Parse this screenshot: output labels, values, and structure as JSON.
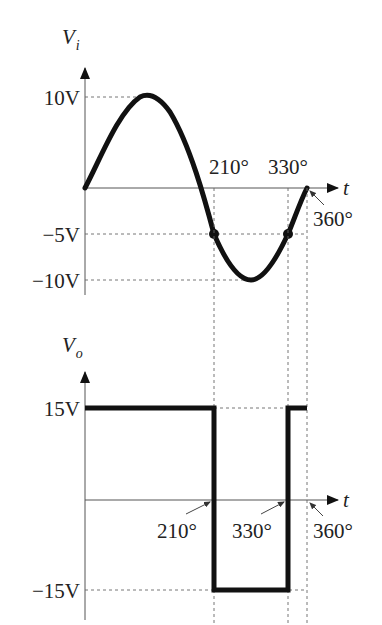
{
  "figure": {
    "type": "comparator waveform diagram",
    "colors": {
      "waveform": "#111111",
      "axis": "#555555",
      "guide": "#666666",
      "text": "#222222"
    }
  },
  "input_plot": {
    "y_axis_label": "V",
    "y_axis_subscript": "i",
    "x_axis_label": "t",
    "y_ticks": [
      {
        "label": "10V",
        "value": 10
      },
      {
        "label": "−5V",
        "value": -5
      },
      {
        "label": "−10V",
        "value": -10
      }
    ],
    "angle_labels": [
      {
        "label": "210°",
        "deg": 210
      },
      {
        "label": "330°",
        "deg": 330
      },
      {
        "label": "360°",
        "deg": 360
      }
    ],
    "waveform": "sine, amplitude 10V, one full period 0°–360°",
    "marked_points": [
      {
        "deg": 210,
        "value": -5
      },
      {
        "deg": 330,
        "value": -5
      }
    ]
  },
  "output_plot": {
    "y_axis_label": "V",
    "y_axis_subscript": "o",
    "x_axis_label": "t",
    "y_ticks": [
      {
        "label": "15V",
        "value": 15
      },
      {
        "label": "−15V",
        "value": -15
      }
    ],
    "angle_labels": [
      {
        "label": "210°",
        "deg": 210
      },
      {
        "label": "330°",
        "deg": 330
      },
      {
        "label": "360°",
        "deg": 360
      }
    ],
    "waveform": "square: +15V for 0°–210°, −15V for 210°–330°, +15V for 330°–360°"
  }
}
